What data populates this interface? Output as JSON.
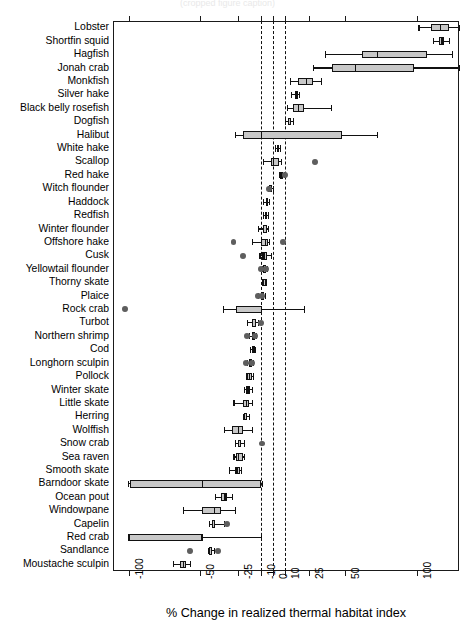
{
  "figure": {
    "top_title_clipped": "(cropped figure caption)",
    "axis_title": "% Change in realized thermal habitat index",
    "accent_box_fill": "#c8c8c8",
    "outlier_color": "#5e5e5e",
    "line_color": "#111111"
  },
  "chart_data": {
    "type": "boxplot",
    "title": "",
    "xlabel": "% Change in realized thermal habitat index",
    "ylabel": "",
    "orientation": "horizontal",
    "x_scale": "symlog-like (nonlinear)",
    "xticks": [
      -100,
      -50,
      -25,
      -10,
      0,
      10,
      25,
      50,
      100
    ],
    "xtick_labels": [
      "-100",
      "-50",
      "-25",
      "-10",
      "0",
      "10",
      "25",
      "50",
      "100"
    ],
    "xlim": [
      -118,
      140
    ],
    "grid": false,
    "legend": null,
    "reference_lines": [
      -10,
      0,
      10
    ],
    "reference_line_style": "dashed",
    "categories": [
      "Lobster",
      "Shortfin squid",
      "Hagfish",
      "Jonah crab",
      "Monkfish",
      "Silver hake",
      "Black belly rosefish",
      "Dogfish",
      "Halibut",
      "White hake",
      "Scallop",
      "Red hake",
      "Witch flounder",
      "Haddock",
      "Redfish",
      "Winter flounder",
      "Offshore hake",
      "Cusk",
      "Yellowtail flounder",
      "Thorny skate",
      "Plaice",
      "Rock crab",
      "Turbot",
      "Northern shrimp",
      "Cod",
      "Longhorn sculpin",
      "Pollock",
      "Winter skate",
      "Little skate",
      "Herring",
      "Wolffish",
      "Snow crab",
      "Sea raven",
      "Smooth skate",
      "Barndoor skate",
      "Ocean pout",
      "Windowpane",
      "Capelin",
      "Red crab",
      "Sandlance",
      "Moustache sculpin"
    ],
    "boxes": [
      {
        "label": "Lobster",
        "whisker_low": 101,
        "q1": 110,
        "median": 116,
        "q3": 122,
        "whisker_high": 132,
        "outliers": []
      },
      {
        "label": "Shortfin squid",
        "whisker_low": 111,
        "q1": 115,
        "median": 117,
        "q3": 119,
        "whisker_high": 122,
        "outliers": []
      },
      {
        "label": "Hagfish",
        "whisker_low": 36,
        "q1": 62,
        "median": 72,
        "q3": 107,
        "whisker_high": 124,
        "outliers": []
      },
      {
        "label": "Jonah crab",
        "whisker_low": 28,
        "q1": 41,
        "median": 57,
        "q3": 98,
        "whisker_high": 135,
        "outliers": []
      },
      {
        "label": "Monkfish",
        "whisker_low": 13,
        "q1": 18,
        "median": 23,
        "q3": 28,
        "whisker_high": 33,
        "outliers": []
      },
      {
        "label": "Black belly rosefish",
        "whisker_low": 14,
        "q1": 16,
        "median": 17,
        "q3": 18,
        "whisker_high": 19,
        "outliers": []
      },
      {
        "label": "Silver hake",
        "whisker_low": 11,
        "q1": 15,
        "median": 18,
        "q3": 22,
        "whisker_high": 40,
        "outliers": []
      },
      {
        "label": "Dogfish",
        "whisker_low": 10,
        "q1": 12,
        "median": 13,
        "q3": 14,
        "whisker_high": 15,
        "outliers": []
      },
      {
        "label": "Halibut",
        "whisker_low": -27,
        "q1": -22,
        "median": -10,
        "q3": 48,
        "whisker_high": 72,
        "outliers": []
      },
      {
        "label": "White hake",
        "whisker_low": 2,
        "q1": 3,
        "median": 4,
        "q3": 5,
        "whisker_high": 6,
        "outliers": []
      },
      {
        "label": "Scallop",
        "whisker_low": -8,
        "q1": -2,
        "median": 0,
        "q3": 5,
        "whisker_high": 7,
        "outliers": [
          29
        ]
      },
      {
        "label": "Red hake",
        "whisker_low": 5,
        "q1": 6,
        "median": 7,
        "q3": 8,
        "whisker_high": 9,
        "outliers": [
          10
        ]
      },
      {
        "label": "Witch flounder",
        "whisker_low": -4,
        "q1": -3,
        "median": -2,
        "q3": -1,
        "whisker_high": 0,
        "outliers": [
          -3
        ]
      },
      {
        "label": "Haddock",
        "whisker_low": -8,
        "q1": -6,
        "median": -5,
        "q3": -4,
        "whisker_high": -3,
        "outliers": []
      },
      {
        "label": "Redfish",
        "whisker_low": -8,
        "q1": -7,
        "median": -6,
        "q3": -5,
        "whisker_high": -4,
        "outliers": []
      },
      {
        "label": "Winter flounder",
        "whisker_low": -12,
        "q1": -8,
        "median": -6,
        "q3": -5,
        "whisker_high": -4,
        "outliers": []
      },
      {
        "label": "Offshore hake",
        "whisker_low": -16,
        "q1": -10,
        "median": -7,
        "q3": -4,
        "whisker_high": -3,
        "outliers": [
          -28,
          8
        ]
      },
      {
        "label": "Cusk",
        "whisker_low": -11,
        "q1": -9,
        "median": -8,
        "q3": -5,
        "whisker_high": -2,
        "outliers": [
          -22
        ]
      },
      {
        "label": "Yellowtail flounder",
        "whisker_low": -9,
        "q1": -8,
        "median": -7,
        "q3": -6,
        "whisker_high": -5,
        "outliers": [
          -10,
          -6
        ]
      },
      {
        "label": "Thorny skate",
        "whisker_low": -9,
        "q1": -8,
        "median": -7,
        "q3": -7,
        "whisker_high": -6,
        "outliers": []
      },
      {
        "label": "Plaice",
        "whisker_low": -12,
        "q1": -10,
        "median": -9,
        "q3": -8,
        "whisker_high": -7,
        "outliers": [
          -12,
          -9
        ]
      },
      {
        "label": "Rock crab",
        "whisker_low": -35,
        "q1": -26,
        "median": -10,
        "q3": -9,
        "whisker_high": 22,
        "outliers": [
          -103
        ]
      },
      {
        "label": "Turbot",
        "whisker_low": -19,
        "q1": -16,
        "median": -14,
        "q3": -13,
        "whisker_high": -12,
        "outliers": [
          -10
        ]
      },
      {
        "label": "Northern shrimp",
        "whisker_low": -18,
        "q1": -16,
        "median": -15,
        "q3": -14,
        "whisker_high": -13,
        "outliers": [
          -19,
          -14
        ]
      },
      {
        "label": "Cod",
        "whisker_low": -17,
        "q1": -16,
        "median": -15,
        "q3": -15,
        "whisker_high": -14,
        "outliers": []
      },
      {
        "label": "Longhorn sculpin",
        "whisker_low": -19,
        "q1": -18,
        "median": -17,
        "q3": -16,
        "whisker_high": -15,
        "outliers": [
          -20,
          -16
        ]
      },
      {
        "label": "Pollock",
        "whisker_low": -20,
        "q1": -19,
        "median": -18,
        "q3": -16,
        "whisker_high": -15,
        "outliers": []
      },
      {
        "label": "Winter skate",
        "whisker_low": -21,
        "q1": -20,
        "median": -19,
        "q3": -17,
        "whisker_high": -16,
        "outliers": []
      },
      {
        "label": "Little skate",
        "whisker_low": -28,
        "q1": -22,
        "median": -20,
        "q3": -18,
        "whisker_high": -16,
        "outliers": []
      },
      {
        "label": "Herring",
        "whisker_low": -22,
        "q1": -21,
        "median": -20,
        "q3": -19,
        "whisker_high": -18,
        "outliers": []
      },
      {
        "label": "Wolffish",
        "whisker_low": -34,
        "q1": -29,
        "median": -25,
        "q3": -22,
        "whisker_high": -16,
        "outliers": []
      },
      {
        "label": "Snow crab",
        "whisker_low": -27,
        "q1": -25,
        "median": -24,
        "q3": -23,
        "whisker_high": -21,
        "outliers": [
          -9
        ]
      },
      {
        "label": "Sea raven",
        "whisker_low": -28,
        "q1": -26,
        "median": -25,
        "q3": -22,
        "whisker_high": -21,
        "outliers": []
      },
      {
        "label": "Smooth skate",
        "whisker_low": -31,
        "q1": -27,
        "median": -26,
        "q3": -24,
        "whisker_high": -23,
        "outliers": []
      },
      {
        "label": "Barndoor skate",
        "whisker_low": -101,
        "q1": -99,
        "median": -49,
        "q3": -10,
        "whisker_high": -9,
        "outliers": []
      },
      {
        "label": "Ocean pout",
        "whisker_low": -40,
        "q1": -36,
        "median": -34,
        "q3": -32,
        "whisker_high": -29,
        "outliers": []
      },
      {
        "label": "Windowpane",
        "whisker_low": -62,
        "q1": -49,
        "median": -41,
        "q3": -36,
        "whisker_high": -27,
        "outliers": []
      },
      {
        "label": "Capelin",
        "whisker_low": -44,
        "q1": -42,
        "median": -41,
        "q3": -40,
        "whisker_high": -34,
        "outliers": [
          -32
        ]
      },
      {
        "label": "Red crab",
        "whisker_low": -101,
        "q1": -100,
        "median": -49,
        "q3": -49,
        "whisker_high": -10,
        "outliers": []
      },
      {
        "label": "Sandlance",
        "whisker_low": -45,
        "q1": -44,
        "median": -43,
        "q3": -42,
        "whisker_high": -41,
        "outliers": [
          -57,
          -38
        ]
      },
      {
        "label": "Moustache sculpin",
        "whisker_low": -69,
        "q1": -64,
        "median": -62,
        "q3": -60,
        "whisker_high": -57,
        "outliers": []
      }
    ]
  }
}
